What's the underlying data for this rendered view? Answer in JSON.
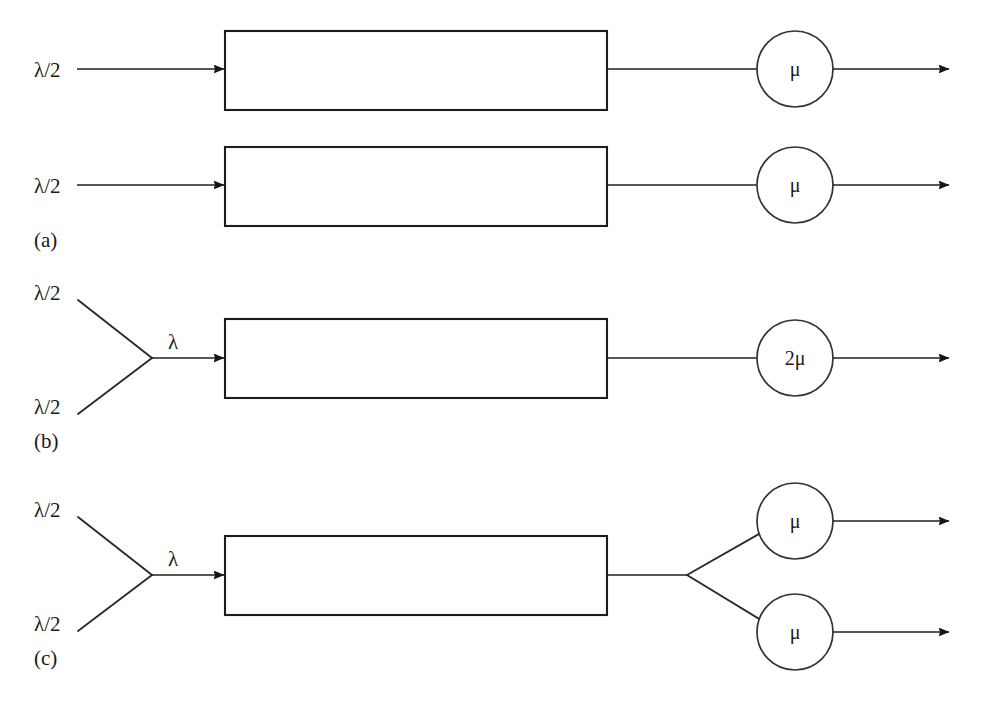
{
  "figure": {
    "background_color": "#ffffff",
    "line_color": "#1a1a1a",
    "box_fill": "#ffffff"
  },
  "symbols": {
    "lambda_half": "λ/2",
    "lambda": "λ",
    "mu": "μ",
    "two_mu": "2μ"
  },
  "panels": [
    {
      "id": "a",
      "label": "(a)",
      "description": "Two independent single-server queues, each fed by arrival rate lambda/2",
      "rows": [
        {
          "arrival_label": "λ/2",
          "queue_box": true,
          "server_label": "μ",
          "departure_arrow": true
        },
        {
          "arrival_label": "λ/2",
          "queue_box": true,
          "server_label": "μ",
          "departure_arrow": true
        }
      ]
    },
    {
      "id": "b",
      "label": "(b)",
      "description": "Two arrival streams merged into one queue served by a single fast server",
      "arrival_labels": [
        "λ/2",
        "λ/2"
      ],
      "merged_label": "λ",
      "queue_box": true,
      "servers": [
        {
          "label": "2μ"
        }
      ]
    },
    {
      "id": "c",
      "label": "(c)",
      "description": "Two arrival streams merged into one queue served by two parallel servers",
      "arrival_labels": [
        "λ/2",
        "λ/2"
      ],
      "merged_label": "λ",
      "queue_box": true,
      "servers": [
        {
          "label": "μ"
        },
        {
          "label": "μ"
        }
      ]
    }
  ]
}
